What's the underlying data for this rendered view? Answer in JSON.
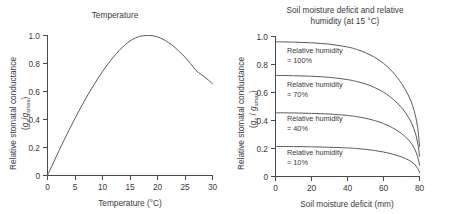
{
  "figure": {
    "background": "#ffffff",
    "curve_color": "#5a5a5a",
    "axis_color": "#4a4a4a",
    "text_color": "#3a3a3a"
  },
  "panels": {
    "left": {
      "title": "Temperature",
      "ylabel_line1": "Relative stomatal conductance",
      "ylabel_line2_pre": "(",
      "ylabel_g1": "g",
      "ylabel_sub1": "s",
      "ylabel_slash": "/",
      "ylabel_g2": "g",
      "ylabel_sub2": "smax",
      "ylabel_line2_post": ")",
      "xlabel": "Temperature (°C)"
    },
    "right": {
      "title": "Soil moisture deficit and relative\nhumidity (at 15 °C)",
      "ylabel_line1": "Relative stomatal conductance",
      "ylabel_line2_pre": "(",
      "ylabel_g1": "g",
      "ylabel_sub1": "s",
      "ylabel_slash": " / ",
      "ylabel_g2": "g",
      "ylabel_sub2": "smax",
      "ylabel_line2_post": ")",
      "xlabel": "Soil moisture deficit (mm)",
      "annotations": [
        {
          "line1": "Relative humidity",
          "line2": "= 100%"
        },
        {
          "line1": "Relative humidity",
          "line2": "= 70%"
        },
        {
          "line1": "Relative humidity",
          "line2": "= 40%"
        },
        {
          "line1": "Relative humidity",
          "line2": "= 10%"
        }
      ]
    }
  },
  "chart_data": [
    {
      "type": "line",
      "title": "Temperature",
      "xlabel": "Temperature (°C)",
      "ylabel": "Relative stomatal conductance (gs/gsmax)",
      "xlim": [
        0,
        30
      ],
      "ylim": [
        0,
        1.0
      ],
      "xticks": [
        0,
        5,
        10,
        15,
        20,
        25,
        30
      ],
      "yticks": [
        0,
        0.2,
        0.4,
        0.6,
        0.8,
        1.0
      ],
      "ytick_labels": [
        "0",
        "0.2",
        "0.4",
        "0.6",
        "0.8",
        "1.0"
      ],
      "xtick_labels": [
        "0",
        "5",
        "10",
        "15",
        "20",
        "25",
        "30"
      ],
      "grid": false,
      "legend": "none",
      "series": [
        {
          "name": "Temperature response",
          "x": [
            0,
            1,
            2,
            3,
            4,
            5,
            6,
            7,
            8,
            9,
            10,
            11,
            12,
            13,
            14,
            15,
            16,
            17,
            18,
            19,
            20,
            21,
            22,
            23,
            24,
            25,
            26,
            27,
            28,
            29,
            30
          ],
          "values": [
            0.0,
            0.085,
            0.17,
            0.252,
            0.331,
            0.408,
            0.482,
            0.553,
            0.62,
            0.683,
            0.742,
            0.797,
            0.847,
            0.891,
            0.93,
            0.961,
            0.983,
            0.996,
            1.0,
            0.999,
            0.99,
            0.973,
            0.95,
            0.92,
            0.885,
            0.845,
            0.8,
            0.75,
            0.72,
            0.69,
            0.655
          ]
        }
      ]
    },
    {
      "type": "line",
      "title": "Soil moisture deficit and relative humidity (at 15 °C)",
      "xlabel": "Soil moisture deficit (mm)",
      "ylabel": "Relative stomatal conductance (gs/gsmax)",
      "xlim": [
        0,
        80
      ],
      "ylim": [
        0,
        1.0
      ],
      "xticks": [
        0,
        20,
        40,
        60,
        80
      ],
      "yticks": [
        0,
        0.2,
        0.4,
        0.6,
        0.8,
        1.0
      ],
      "ytick_labels": [
        "0",
        "0.2",
        "0.4",
        "0.6",
        "0.8",
        "1.0"
      ],
      "xtick_labels": [
        "0",
        "20",
        "40",
        "60",
        "80"
      ],
      "grid": false,
      "legend": "inline-annotations",
      "series": [
        {
          "name": "Relative humidity = 100%",
          "x": [
            0,
            10,
            20,
            30,
            40,
            45,
            50,
            55,
            60,
            65,
            70,
            74,
            77,
            79,
            80
          ],
          "values": [
            0.962,
            0.96,
            0.955,
            0.945,
            0.925,
            0.908,
            0.884,
            0.852,
            0.808,
            0.748,
            0.665,
            0.575,
            0.472,
            0.35,
            0.215
          ]
        },
        {
          "name": "Relative humidity = 70%",
          "x": [
            0,
            10,
            20,
            30,
            40,
            45,
            50,
            55,
            60,
            65,
            70,
            74,
            77,
            79,
            80
          ],
          "values": [
            0.722,
            0.72,
            0.716,
            0.708,
            0.692,
            0.679,
            0.661,
            0.636,
            0.602,
            0.556,
            0.492,
            0.42,
            0.338,
            0.24,
            0.145
          ]
        },
        {
          "name": "Relative humidity = 40%",
          "x": [
            0,
            10,
            20,
            30,
            40,
            45,
            50,
            55,
            60,
            65,
            70,
            74,
            77,
            79,
            80
          ],
          "values": [
            0.455,
            0.454,
            0.451,
            0.446,
            0.436,
            0.428,
            0.416,
            0.4,
            0.378,
            0.348,
            0.307,
            0.26,
            0.205,
            0.14,
            0.08
          ]
        },
        {
          "name": "Relative humidity = 10%",
          "x": [
            0,
            10,
            20,
            30,
            40,
            45,
            50,
            55,
            60,
            65,
            70,
            74,
            77,
            79,
            80
          ],
          "values": [
            0.215,
            0.214,
            0.212,
            0.209,
            0.204,
            0.2,
            0.194,
            0.186,
            0.175,
            0.16,
            0.14,
            0.117,
            0.09,
            0.058,
            0.028
          ]
        }
      ]
    }
  ]
}
